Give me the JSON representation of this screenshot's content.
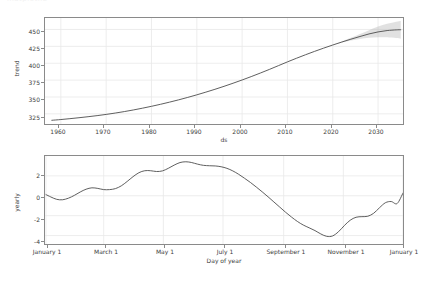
{
  "figure": {
    "clipped_title": "matplotlib",
    "background_color": "#ffffff",
    "line_color": "#4d4d4d",
    "band_color": "#b0b0b0",
    "grid_color": "#e8e8e8",
    "axis_color": "#8a8a8a"
  },
  "chart_data": [
    {
      "type": "line",
      "name": "trend-panel",
      "title": "",
      "xlabel": "ds",
      "ylabel": "trend",
      "xlim": [
        1956.5,
        2035.5
      ],
      "ylim": [
        310,
        467
      ],
      "grid": true,
      "legend": "none",
      "xticks": [
        1960,
        1970,
        1980,
        1990,
        2000,
        2010,
        2020,
        2030
      ],
      "xtick_labels": [
        "1960",
        "1970",
        "1980",
        "1990",
        "2000",
        "2010",
        "2020",
        "2030"
      ],
      "yticks": [
        325,
        350,
        375,
        400,
        425,
        450
      ],
      "ytick_labels": [
        "325",
        "350",
        "375",
        "400",
        "425",
        "450"
      ],
      "series": [
        {
          "name": "trend",
          "x": [
            1958,
            1960,
            1962,
            1964,
            1966,
            1968,
            1970,
            1972,
            1974,
            1976,
            1978,
            1980,
            1982,
            1984,
            1986,
            1988,
            1990,
            1992,
            1994,
            1996,
            1998,
            2000,
            2002,
            2004,
            2006,
            2008,
            2010,
            2012,
            2014,
            2016,
            2018,
            2020,
            2022,
            2024,
            2026,
            2028,
            2030,
            2032,
            2034,
            2035
          ],
          "y": [
            315.5,
            316.6,
            317.9,
            319.3,
            320.8,
            322.4,
            324.2,
            326.2,
            328.4,
            330.8,
            333.4,
            336.2,
            339.2,
            342.4,
            345.8,
            349.4,
            353.2,
            357.2,
            361.4,
            365.8,
            370.4,
            375.2,
            380.2,
            385.4,
            390.8,
            396.4,
            402.0,
            407.4,
            412.6,
            417.6,
            422.4,
            427.0,
            431.4,
            435.6,
            439.6,
            443.4,
            446.4,
            448.4,
            449.4,
            449.6
          ]
        }
      ],
      "uncertainty_band": {
        "name": "trend-uncertainty",
        "x": [
          2020,
          2022,
          2024,
          2026,
          2028,
          2030,
          2032,
          2034,
          2035
        ],
        "lower": [
          427.0,
          430.6,
          433.6,
          436.0,
          437.6,
          438.6,
          438.4,
          437.2,
          436.4
        ],
        "upper": [
          427.0,
          432.2,
          437.6,
          443.2,
          448.8,
          454.4,
          458.6,
          461.6,
          462.6
        ]
      }
    },
    {
      "type": "line",
      "name": "yearly-panel",
      "title": "",
      "xlabel": "Day of year",
      "ylabel": "yearly",
      "xlim": [
        0,
        366
      ],
      "ylim": [
        -4.85,
        4.0
      ],
      "grid": true,
      "legend": "none",
      "xticks": [
        1,
        60,
        121,
        182,
        244,
        305,
        366
      ],
      "xtick_labels": [
        "January 1",
        "March 1",
        "May 1",
        "July 1",
        "September 1",
        "November 1",
        "January 1"
      ],
      "yticks": [
        2,
        0,
        -2,
        -4
      ],
      "ytick_labels": [
        "2",
        "0",
        "-2",
        "-4"
      ],
      "series": [
        {
          "name": "yearly",
          "x": [
            1,
            6,
            12,
            18,
            24,
            30,
            36,
            42,
            48,
            54,
            60,
            66,
            72,
            78,
            84,
            90,
            96,
            102,
            108,
            114,
            120,
            126,
            132,
            138,
            144,
            150,
            156,
            162,
            168,
            174,
            180,
            186,
            192,
            198,
            204,
            210,
            216,
            222,
            228,
            234,
            240,
            246,
            252,
            258,
            264,
            270,
            276,
            282,
            288,
            294,
            300,
            306,
            312,
            318,
            324,
            330,
            336,
            342,
            348,
            354,
            360,
            366
          ],
          "y": [
            0.12,
            -0.12,
            -0.36,
            -0.4,
            -0.24,
            0.04,
            0.38,
            0.66,
            0.8,
            0.74,
            0.62,
            0.62,
            0.72,
            1.0,
            1.44,
            1.92,
            2.32,
            2.52,
            2.52,
            2.44,
            2.5,
            2.76,
            3.08,
            3.34,
            3.42,
            3.34,
            3.18,
            3.06,
            3.02,
            3.0,
            2.92,
            2.76,
            2.5,
            2.16,
            1.76,
            1.34,
            0.88,
            0.4,
            -0.1,
            -0.62,
            -1.14,
            -1.66,
            -2.14,
            -2.58,
            -2.94,
            -3.22,
            -3.5,
            -3.84,
            -4.08,
            -4.04,
            -3.62,
            -3.0,
            -2.46,
            -2.16,
            -2.1,
            -2.06,
            -1.76,
            -1.2,
            -0.7,
            -0.58,
            -0.78,
            0.28
          ]
        }
      ]
    }
  ]
}
